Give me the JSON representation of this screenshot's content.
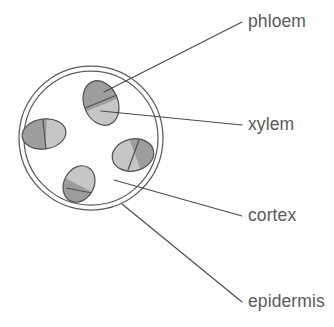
{
  "diagram": {
    "background_color": "#ffffff",
    "line_color": "#4a4a4a",
    "label_color": "#58595b",
    "labels": [
      {
        "id": "phloem",
        "text": "phloem",
        "x": 248,
        "y": 27,
        "anchor": "start"
      },
      {
        "id": "xylem",
        "text": "xylem",
        "x": 248,
        "y": 130,
        "anchor": "start"
      },
      {
        "id": "cortex",
        "text": "cortex",
        "x": 248,
        "y": 221,
        "anchor": "start"
      },
      {
        "id": "epidermis",
        "text": "epidermis",
        "x": 248,
        "y": 307,
        "anchor": "start"
      }
    ],
    "leader_lines": [
      {
        "id": "phloem-leader",
        "x1": 242,
        "y1": 22,
        "x2": 104,
        "y2": 92
      },
      {
        "id": "xylem-leader",
        "x1": 242,
        "y1": 125,
        "x2": 101,
        "y2": 111
      },
      {
        "id": "cortex-leader",
        "x1": 242,
        "y1": 216,
        "x2": 114,
        "y2": 180
      },
      {
        "id": "epidermis-leader",
        "x1": 242,
        "y1": 302,
        "x2": 122,
        "y2": 204
      }
    ],
    "epidermis": {
      "center_x": 91,
      "center_y": 138,
      "outer_radius": 72,
      "inner_radius": 67,
      "stroke": "#5a5a5a"
    },
    "cortex": {
      "fill": "#ffffff",
      "description": "clear region between epidermis and vascular bundles"
    },
    "bundle_colors": {
      "phloem_fill": "#9d9d9d",
      "xylem_fill": "#c6c6c6",
      "outline": "#4f4f4f"
    },
    "vascular_bundles": [
      {
        "id": "bundle-top",
        "cx": 101,
        "cy": 103,
        "rx": 17,
        "ry": 23,
        "rotation": -22,
        "phloem_side": "upper",
        "divider_angle": -22
      },
      {
        "id": "bundle-left",
        "cx": 44,
        "cy": 134,
        "rx": 22,
        "ry": 15,
        "rotation": -8,
        "phloem_side": "left",
        "divider_angle": 78
      },
      {
        "id": "bundle-right",
        "cx": 133,
        "cy": 155,
        "rx": 21,
        "ry": 16,
        "rotation": -12,
        "phloem_side": "right",
        "divider_angle": 68
      },
      {
        "id": "bundle-bottom",
        "cx": 79,
        "cy": 184,
        "rx": 15,
        "ry": 19,
        "rotation": 28,
        "phloem_side": "lower-left",
        "divider_angle": 28
      }
    ]
  }
}
